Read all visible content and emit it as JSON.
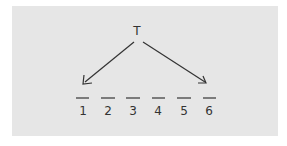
{
  "diagram": {
    "root_label": "T",
    "slots": [
      "1",
      "2",
      "3",
      "4",
      "5",
      "6"
    ],
    "arrows": [
      {
        "from": "T",
        "to": "1"
      },
      {
        "from": "T",
        "to": "6"
      }
    ],
    "colors": {
      "background": "#e6e6e6",
      "ink": "#333333"
    }
  }
}
